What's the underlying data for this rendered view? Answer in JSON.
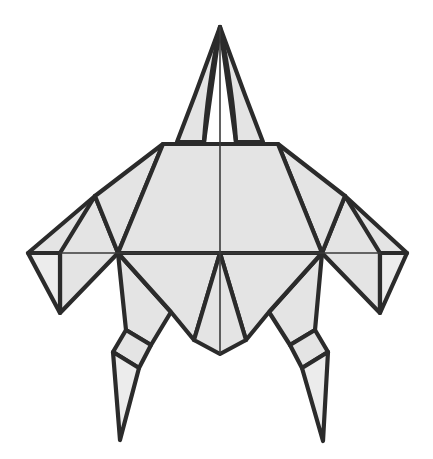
{
  "figure": {
    "canvas": {
      "width": 433,
      "height": 459
    },
    "background_color": "#ffffff",
    "fill_color": "#e4e4e4",
    "fill_color_light": "#ececec",
    "stroke_color": "#2b2b2b",
    "inner_stroke_color": "#3a3a3a",
    "outer_stroke_width": 4.2,
    "inner_stroke_width": 2.6,
    "thin_stroke_width": 1.6
  },
  "geometry": {
    "beak_left_flap": "220,27 195,95 177,142 204,142",
    "beak_right_flap": "220,27 245,95 263,142 236,142",
    "beak_inner_left": "220,27 206,105 204,142",
    "beak_inner_right": "220,27 234,105 236,142",
    "body_upper": "163,144 278,144 322,253 118,253",
    "body_lower_left": "118,253 220,253 194,340 171,312",
    "body_lower_right": "322,253 220,253 246,340 269,312",
    "body_keel": "194,340 220,354 246,340 220,253",
    "shoulder_left": "163,144 95,196 118,253",
    "shoulder_right": "278,144 345,196 322,253",
    "wing_left_upper": "95,196 28,253 60,253 118,253",
    "wing_left_panel": "95,196 60,253 60,313 118,253",
    "wing_left_tip": "28,253 60,253 60,313",
    "wing_right_upper": "345,196 407,253 380,253 322,253",
    "wing_right_panel": "345,196 380,253 380,313 322,253",
    "wing_right_tip": "407,253 380,253 380,313",
    "leg_left_thigh": "118,253 171,312 151,345 126,330",
    "leg_left_shin": "126,330 151,345 139,368 113,352",
    "leg_left_claw": "113,352 139,368 120,440",
    "leg_right_thigh": "322,253 269,312 290,345 315,330",
    "leg_right_shin": "315,330 290,345 302,368 328,352",
    "leg_right_claw": "328,352 302,368 323,441",
    "axis_vertical": "220,27 220,354",
    "axis_horizontal": "60,253 380,253"
  },
  "layers": {
    "outline_label": "figure-outline",
    "fold_label": "fold-lines",
    "axis_label": "center-axes"
  }
}
